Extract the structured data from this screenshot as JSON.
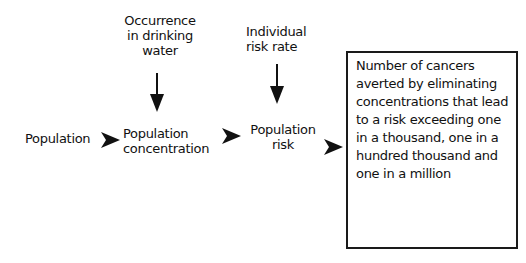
{
  "diagram": {
    "nodes": {
      "occurrence": "Occurrence\nin drinking\nwater",
      "individual_risk_rate": "Individual\nrisk rate",
      "population": "Population",
      "population_concentration": "Population\nconcentration",
      "population_risk": "Population\nrisk",
      "outcome": "Number of cancers averted by eliminating concentrations that lead to a risk exceeding one in a thousand, one in a hundred thousand and one in a million"
    },
    "edges": [
      {
        "from": "occurrence",
        "to": "population_concentration"
      },
      {
        "from": "population",
        "to": "population_concentration"
      },
      {
        "from": "population_concentration",
        "to": "population_risk"
      },
      {
        "from": "individual_risk_rate",
        "to": "population_risk"
      },
      {
        "from": "population_risk",
        "to": "outcome"
      }
    ],
    "colors": {
      "ink": "#111111",
      "background": "#ffffff"
    }
  }
}
